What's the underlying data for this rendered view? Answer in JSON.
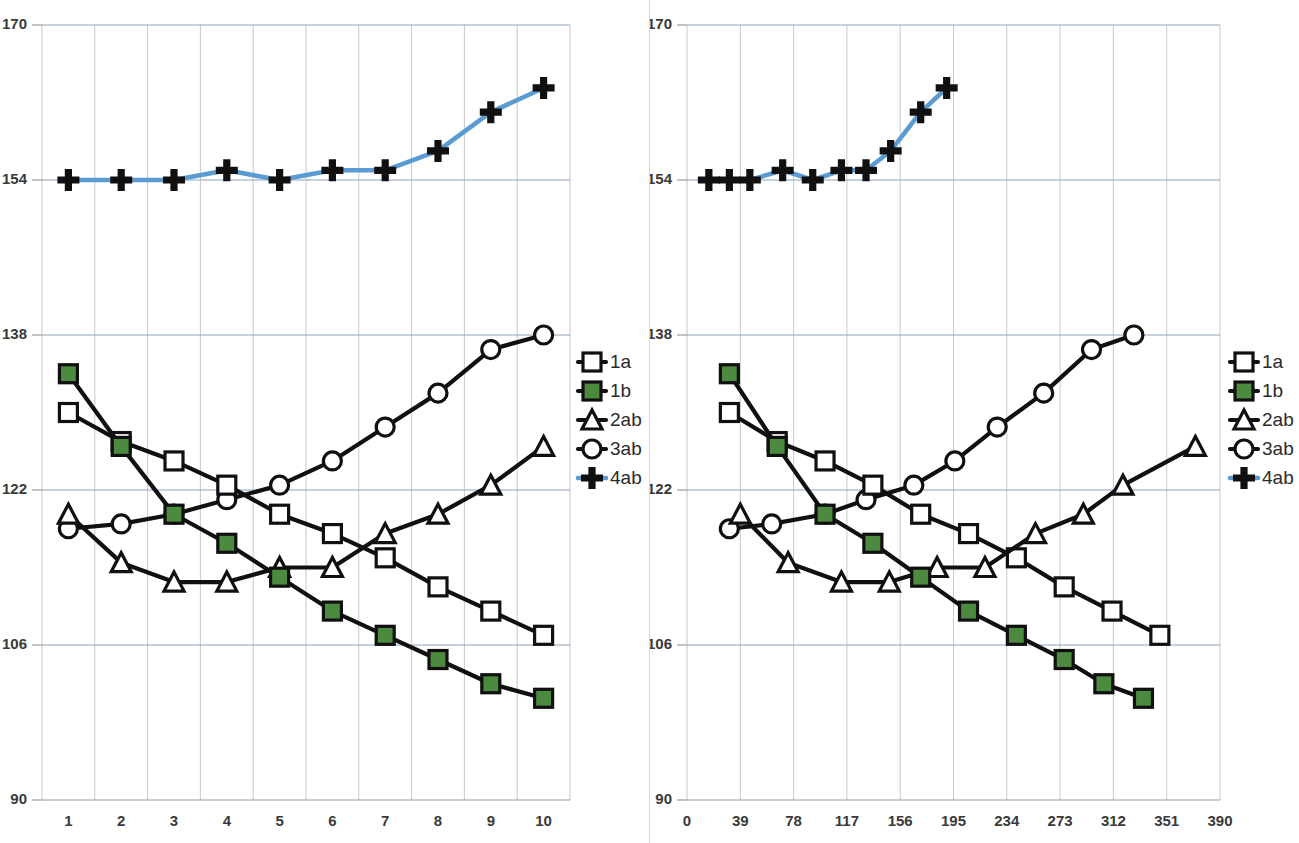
{
  "figure": {
    "panels": [
      {
        "id": "left",
        "name": "categorical-axis-chart"
      },
      {
        "id": "right",
        "name": "numeric-axis-chart"
      }
    ],
    "colors": {
      "series_dark": "#101010",
      "series_blue": "#5b9bd1",
      "marker_green": "#4c8a3f",
      "gridline_horizontal": "#8ba3bf",
      "gridline_vertical": "#c9c9c9",
      "axis": "#9a9a9a",
      "text": "#3a3a3a",
      "background": "#ffffff"
    }
  },
  "legend": {
    "position": "right",
    "entries": [
      {
        "label": "1a",
        "marker": "open-square",
        "line_color": "#101010",
        "fill": "#ffffff"
      },
      {
        "label": "1b",
        "marker": "filled-square",
        "line_color": "#101010",
        "fill": "#4c8a3f"
      },
      {
        "label": "2ab",
        "marker": "open-triangle",
        "line_color": "#101010",
        "fill": "#ffffff"
      },
      {
        "label": "3ab",
        "marker": "open-circle",
        "line_color": "#101010",
        "fill": "#ffffff"
      },
      {
        "label": "4ab",
        "marker": "plus-cross",
        "line_color": "#5b9bd1",
        "fill": "#101010"
      }
    ]
  },
  "chart_data": [
    {
      "type": "line",
      "panel": "left",
      "title": "",
      "xlabel": "",
      "ylabel": "",
      "xlim": [
        0.5,
        10.5
      ],
      "ylim": [
        90,
        170
      ],
      "grid": true,
      "x_axis_type": "category",
      "categories": [
        "1",
        "2",
        "3",
        "4",
        "5",
        "6",
        "7",
        "8",
        "9",
        "10"
      ],
      "x_tick_labels": [
        "1",
        "2",
        "3",
        "4",
        "5",
        "6",
        "7",
        "8",
        "9",
        "10"
      ],
      "y_tick_labels": [
        "90",
        "106",
        "122",
        "138",
        "154",
        "170"
      ],
      "y_ticks": [
        90,
        106,
        122,
        138,
        154,
        170
      ],
      "legend_position": "right",
      "series": [
        {
          "name": "1a",
          "marker": "open-square",
          "color": "#101010",
          "values": [
            130.0,
            127.0,
            125.0,
            122.5,
            119.5,
            117.5,
            115.0,
            112.0,
            109.5,
            107.0
          ]
        },
        {
          "name": "1b",
          "marker": "filled-square",
          "color": "#4c8a3f",
          "values": [
            134.0,
            126.5,
            119.5,
            116.5,
            113.0,
            109.5,
            107.0,
            104.5,
            102.0,
            100.5
          ]
        },
        {
          "name": "2ab",
          "marker": "open-triangle",
          "color": "#101010",
          "values": [
            119.5,
            114.5,
            112.5,
            112.5,
            114.0,
            114.0,
            117.5,
            119.5,
            122.5,
            126.5
          ]
        },
        {
          "name": "3ab",
          "marker": "open-circle",
          "color": "#101010",
          "values": [
            118.0,
            118.5,
            119.5,
            121.0,
            122.5,
            125.0,
            128.5,
            132.0,
            136.5,
            138.0
          ]
        },
        {
          "name": "4ab",
          "marker": "plus-cross",
          "color": "#5b9bd1",
          "values": [
            154.0,
            154.0,
            154.0,
            155.0,
            154.0,
            155.0,
            155.0,
            157.0,
            161.0,
            163.5
          ]
        }
      ]
    },
    {
      "type": "line",
      "panel": "right",
      "title": "",
      "xlabel": "",
      "ylabel": "",
      "xlim": [
        0,
        390
      ],
      "ylim": [
        90,
        170
      ],
      "grid": true,
      "x_axis_type": "numeric",
      "x_tick_labels": [
        "0",
        "39",
        "78",
        "117",
        "156",
        "195",
        "234",
        "273",
        "312",
        "351",
        "390"
      ],
      "x_ticks": [
        0,
        39,
        78,
        117,
        156,
        195,
        234,
        273,
        312,
        351,
        390
      ],
      "y_tick_labels": [
        "90",
        "106",
        "122",
        "138",
        "154",
        "170"
      ],
      "y_ticks": [
        90,
        106,
        122,
        138,
        154,
        170
      ],
      "legend_position": "right",
      "series": [
        {
          "name": "1a",
          "marker": "open-square",
          "color": "#101010",
          "x": [
            31,
            66,
            101,
            136,
            171,
            206,
            241,
            276,
            311,
            346
          ],
          "values": [
            130.0,
            127.0,
            125.0,
            122.5,
            119.5,
            117.5,
            115.0,
            112.0,
            109.5,
            107.0
          ]
        },
        {
          "name": "1b",
          "marker": "filled-square",
          "color": "#4c8a3f",
          "x": [
            31,
            66,
            101,
            136,
            171,
            206,
            241,
            276,
            305,
            334
          ],
          "values": [
            134.0,
            126.5,
            119.5,
            116.5,
            113.0,
            109.5,
            107.0,
            104.5,
            102.0,
            100.5
          ]
        },
        {
          "name": "2ab",
          "marker": "open-triangle",
          "color": "#101010",
          "x": [
            39,
            74,
            113,
            148,
            183,
            218,
            255,
            290,
            319,
            372
          ],
          "values": [
            119.5,
            114.5,
            112.5,
            112.5,
            114.0,
            114.0,
            117.5,
            119.5,
            122.5,
            126.5
          ]
        },
        {
          "name": "3ab",
          "marker": "open-circle",
          "color": "#101010",
          "x": [
            31,
            62,
            101,
            131,
            166,
            196,
            227,
            261,
            296,
            327
          ],
          "values": [
            118.0,
            118.5,
            119.5,
            121.0,
            122.5,
            125.0,
            128.5,
            132.0,
            136.5,
            138.0
          ]
        },
        {
          "name": "4ab",
          "marker": "plus-cross",
          "color": "#5b9bd1",
          "x": [
            16,
            31,
            46,
            70,
            92,
            113,
            131,
            149,
            171,
            190
          ],
          "values": [
            154.0,
            154.0,
            154.0,
            155.0,
            154.0,
            155.0,
            155.0,
            157.0,
            161.0,
            163.5
          ]
        }
      ]
    }
  ]
}
